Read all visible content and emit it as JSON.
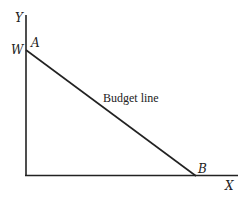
{
  "diagram": {
    "axes": {
      "y_label": "Y",
      "x_label": "X"
    },
    "points": {
      "w_label": "W",
      "a_label": "A",
      "b_label": "B"
    },
    "budget_line_label": "Budget line",
    "colors": {
      "stroke": "#222222",
      "background": "#ffffff"
    }
  }
}
